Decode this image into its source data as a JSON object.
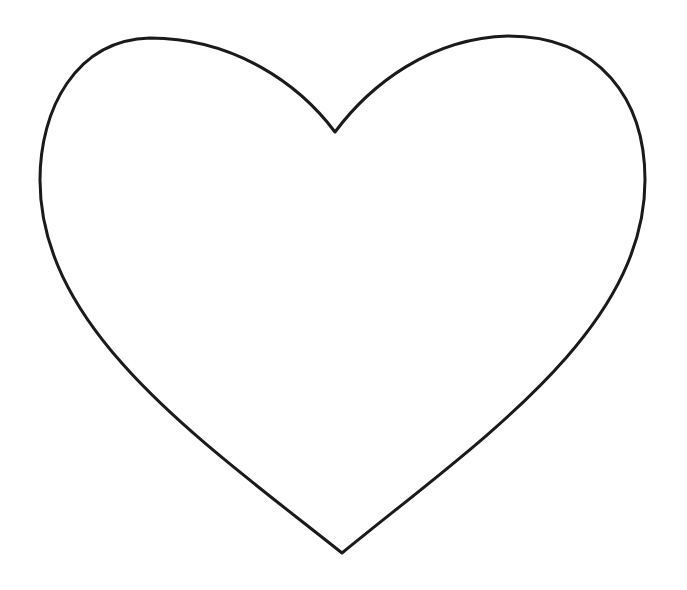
{
  "image": {
    "subject": "heart outline",
    "background_color": "#ffffff",
    "stroke_color": "#1a1a1a",
    "stroke_width": 3,
    "fill": "none",
    "key_points": {
      "top_dip": [
        335,
        132
      ],
      "bottom_tip": [
        342,
        553
      ],
      "left_lobe_top": [
        150,
        38
      ],
      "right_lobe_top": [
        508,
        36
      ],
      "left_extent": [
        40,
        180
      ],
      "right_extent": [
        645,
        180
      ]
    }
  }
}
